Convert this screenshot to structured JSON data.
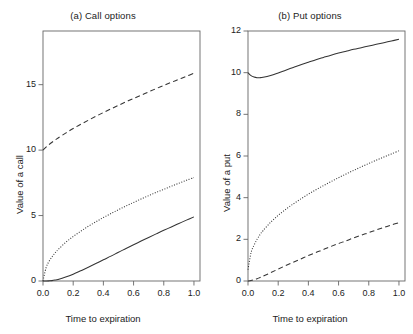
{
  "figure": {
    "width": 413,
    "height": 334,
    "background": "#ffffff",
    "line_color": "#333333"
  },
  "chart_data": [
    {
      "type": "line",
      "panel_id": "a",
      "title": "(a) Call options",
      "xlabel": "Time to expiration",
      "ylabel": "Value of a call",
      "xlim": [
        0,
        1.04
      ],
      "ylim": [
        0,
        19.1
      ],
      "xticks": [
        0.0,
        0.2,
        0.4,
        0.6,
        0.8,
        1.0
      ],
      "xticklabels": [
        "0.0",
        "0.2",
        "0.4",
        "0.6",
        "0.8",
        "1.0"
      ],
      "yticks": [
        0,
        5,
        10,
        15
      ],
      "yticklabels": [
        "0",
        "5",
        "10",
        "15"
      ],
      "grid": false,
      "legend": "none",
      "x": [
        0.0,
        0.02,
        0.04,
        0.06,
        0.08,
        0.1,
        0.15,
        0.2,
        0.25,
        0.3,
        0.35,
        0.4,
        0.45,
        0.5,
        0.55,
        0.6,
        0.65,
        0.7,
        0.75,
        0.8,
        0.85,
        0.9,
        0.95,
        1.0
      ],
      "series": [
        {
          "name": "in-the-money call",
          "linestyle": "dashed",
          "values": [
            10.0,
            10.22,
            10.42,
            10.6,
            10.77,
            10.93,
            11.3,
            11.65,
            11.97,
            12.28,
            12.58,
            12.87,
            13.15,
            13.42,
            13.69,
            13.95,
            14.2,
            14.45,
            14.7,
            14.94,
            15.18,
            15.41,
            15.64,
            15.87
          ]
        },
        {
          "name": "at-the-money call",
          "linestyle": "dotted",
          "values": [
            0.0,
            1.0,
            1.5,
            1.85,
            2.15,
            2.4,
            2.95,
            3.4,
            3.8,
            4.18,
            4.52,
            4.85,
            5.15,
            5.45,
            5.73,
            6.0,
            6.27,
            6.52,
            6.77,
            7.0,
            7.24,
            7.47,
            7.69,
            7.9
          ]
        },
        {
          "name": "out-of-the-money call",
          "linestyle": "solid",
          "values": [
            0.0,
            0.0,
            0.01,
            0.03,
            0.07,
            0.12,
            0.3,
            0.52,
            0.78,
            1.05,
            1.33,
            1.62,
            1.9,
            2.2,
            2.48,
            2.77,
            3.05,
            3.33,
            3.6,
            3.87,
            4.13,
            4.39,
            4.65,
            4.9
          ]
        }
      ],
      "y_display_scale_note": "values plotted against ylim 0 to 19.1"
    },
    {
      "type": "line",
      "panel_id": "b",
      "title": "(b) Put options",
      "xlabel": "Time to expiration",
      "ylabel": "Value of a put",
      "xlim": [
        0,
        1.04
      ],
      "ylim": [
        0,
        12
      ],
      "xticks": [
        0.0,
        0.2,
        0.4,
        0.6,
        0.8,
        1.0
      ],
      "xticklabels": [
        "0.0",
        "0.2",
        "0.4",
        "0.6",
        "0.8",
        "1.0"
      ],
      "yticks": [
        0,
        2,
        4,
        6,
        8,
        10,
        12
      ],
      "yticklabels": [
        "0",
        "2",
        "4",
        "6",
        "8",
        "10",
        "12"
      ],
      "grid": false,
      "legend": "none",
      "x": [
        0.0,
        0.02,
        0.04,
        0.06,
        0.08,
        0.1,
        0.15,
        0.2,
        0.25,
        0.3,
        0.35,
        0.4,
        0.45,
        0.5,
        0.55,
        0.6,
        0.65,
        0.7,
        0.75,
        0.8,
        0.85,
        0.9,
        0.95,
        1.0
      ],
      "series": [
        {
          "name": "in-the-money put",
          "linestyle": "solid",
          "values": [
            10.0,
            9.86,
            9.79,
            9.76,
            9.76,
            9.78,
            9.87,
            9.99,
            10.12,
            10.25,
            10.38,
            10.5,
            10.62,
            10.73,
            10.84,
            10.94,
            11.03,
            11.12,
            11.2,
            11.28,
            11.36,
            11.44,
            11.52,
            11.6
          ]
        },
        {
          "name": "at-the-money put",
          "linestyle": "dotted",
          "values": [
            0.55,
            1.35,
            1.72,
            2.0,
            2.23,
            2.42,
            2.82,
            3.15,
            3.44,
            3.7,
            3.94,
            4.17,
            4.38,
            4.58,
            4.77,
            4.96,
            5.14,
            5.31,
            5.48,
            5.64,
            5.8,
            5.95,
            6.1,
            6.25
          ]
        },
        {
          "name": "out-of-the-money put",
          "linestyle": "dashed",
          "values": [
            0.0,
            0.02,
            0.06,
            0.11,
            0.17,
            0.23,
            0.4,
            0.57,
            0.74,
            0.9,
            1.06,
            1.22,
            1.37,
            1.51,
            1.66,
            1.8,
            1.93,
            2.07,
            2.2,
            2.32,
            2.45,
            2.57,
            2.69,
            2.8
          ]
        }
      ]
    }
  ]
}
